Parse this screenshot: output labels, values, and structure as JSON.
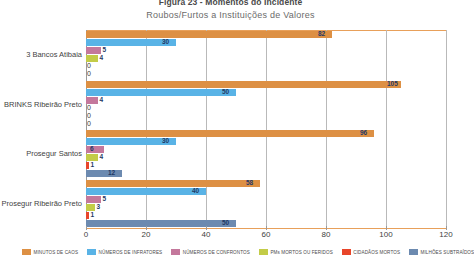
{
  "chart_data": {
    "type": "bar",
    "orientation": "horizontal",
    "title": "Figura 23 - Momentos do Incidente",
    "subtitle": "Roubos/Furtos a Instituições de Valores",
    "xlabel": "",
    "ylabel": "",
    "xlim": [
      0,
      120
    ],
    "xticks": [
      0,
      20,
      40,
      60,
      80,
      100,
      120
    ],
    "grid": true,
    "legend_position": "bottom",
    "categories": [
      "3 Bancos Atibaia",
      "BRINKS Ribeirão Preto",
      "Prosegur Santos",
      "Prosegur Ribeirão Preto"
    ],
    "series": [
      {
        "name": "MINUTOS DE CAOS",
        "color": "#dd9044",
        "values": [
          82,
          105,
          96,
          58
        ],
        "labels": [
          "82",
          "105",
          "96",
          "58"
        ]
      },
      {
        "name": "NÚMEROS DE INFRATORES",
        "color": "#59b3e6",
        "values": [
          30,
          50,
          30,
          40
        ],
        "labels": [
          "30",
          "50",
          "30",
          "40"
        ]
      },
      {
        "name": "NÚMEROS DE CONFRONTOS",
        "color": "#c4789c",
        "values": [
          5,
          4,
          6,
          5
        ],
        "labels": [
          "5",
          "4",
          "6",
          "5"
        ]
      },
      {
        "name": "PMs MORTOS OU FERIDOS",
        "color": "#c3cc48",
        "values": [
          4,
          0,
          4,
          3
        ],
        "labels": [
          "4",
          "0",
          "4",
          "3"
        ]
      },
      {
        "name": "CIDADÃOS MORTOS",
        "color": "#e8452a",
        "values": [
          0,
          0,
          1,
          1
        ],
        "labels": [
          "0",
          "0",
          "1",
          "1"
        ]
      },
      {
        "name": "MILHÕES SUBTRAÍDOS",
        "color": "#6c8ab0",
        "values": [
          0,
          0,
          12,
          50
        ],
        "labels": [
          "0",
          "0",
          "12",
          "50"
        ]
      }
    ]
  }
}
